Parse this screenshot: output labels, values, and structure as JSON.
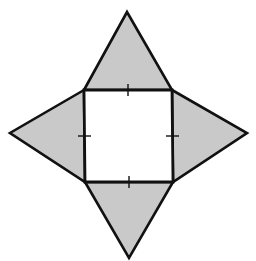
{
  "diagram": {
    "colors": {
      "background": "#ffffff",
      "triangle_fill": "#c9c9c9",
      "square_fill": "#ffffff",
      "stroke": "#111111"
    },
    "square": {
      "vertices": [
        [
          84,
          90
        ],
        [
          172,
          90
        ],
        [
          173,
          182
        ],
        [
          85,
          182
        ]
      ]
    },
    "triangles": [
      {
        "name": "top-triangle",
        "points": [
          [
            84,
            90
          ],
          [
            127,
            12
          ],
          [
            172,
            90
          ]
        ]
      },
      {
        "name": "right-triangle",
        "points": [
          [
            172,
            90
          ],
          [
            247,
            133
          ],
          [
            173,
            182
          ]
        ]
      },
      {
        "name": "bottom-triangle",
        "points": [
          [
            85,
            182
          ],
          [
            129,
            258
          ],
          [
            173,
            182
          ]
        ]
      },
      {
        "name": "left-triangle",
        "points": [
          [
            84,
            90
          ],
          [
            10,
            133
          ],
          [
            85,
            182
          ]
        ]
      }
    ],
    "tick_marks": [
      {
        "name": "top-edge-tick",
        "x1": 128,
        "y1": 84,
        "x2": 128,
        "y2": 96
      },
      {
        "name": "bottom-edge-tick",
        "x1": 129,
        "y1": 176,
        "x2": 129,
        "y2": 188
      },
      {
        "name": "left-edge-tick",
        "x1": 78,
        "y1": 136,
        "x2": 91,
        "y2": 136
      },
      {
        "name": "right-edge-tick",
        "x1": 166,
        "y1": 136,
        "x2": 179,
        "y2": 136
      }
    ]
  }
}
